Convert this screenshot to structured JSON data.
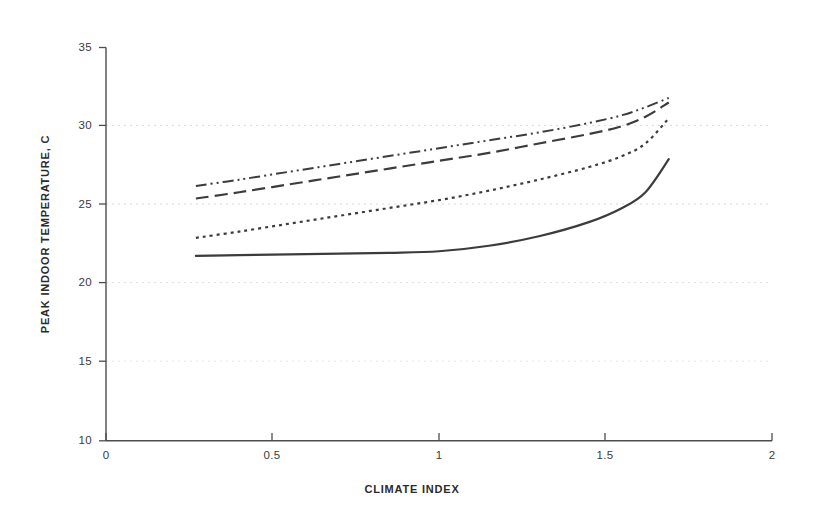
{
  "chart_data": {
    "type": "line",
    "title": "",
    "xlabel": "CLIMATE INDEX",
    "ylabel": "PEAK INDOOR TEMPERATURE, C",
    "xlim": [
      0,
      2
    ],
    "ylim": [
      10,
      35
    ],
    "xticks": [
      "0",
      "0.5",
      "1",
      "1.5",
      "2"
    ],
    "xtick_values": [
      0,
      0.5,
      1,
      1.5,
      2
    ],
    "yticks": [
      "10",
      "15",
      "20",
      "25",
      "30",
      "35"
    ],
    "ytick_values": [
      10,
      15,
      20,
      25,
      30,
      35
    ],
    "grid": "horizontal-dotted-faint",
    "legend": "none",
    "line_color": "#3c3c3c",
    "axis_color": "#555555",
    "grid_color": "#d8d8d8",
    "series": [
      {
        "name": "series-1-dash-dot-dot",
        "style": "dash-dot-dot",
        "dasharray": "11,4,2,4,2,4",
        "width": 2.0,
        "x": [
          0.27,
          0.4,
          0.55,
          0.7,
          0.85,
          1.0,
          1.15,
          1.3,
          1.45,
          1.55,
          1.62,
          1.69
        ],
        "values": [
          26.2,
          26.6,
          27.1,
          27.6,
          28.1,
          28.6,
          29.1,
          29.6,
          30.2,
          30.7,
          31.2,
          31.8
        ]
      },
      {
        "name": "series-2-dashed",
        "style": "dashed",
        "dasharray": "13,6",
        "width": 2.2,
        "x": [
          0.27,
          0.4,
          0.55,
          0.7,
          0.85,
          1.0,
          1.15,
          1.3,
          1.45,
          1.55,
          1.62,
          1.69
        ],
        "values": [
          25.4,
          25.8,
          26.3,
          26.8,
          27.3,
          27.8,
          28.3,
          28.9,
          29.5,
          30.0,
          30.6,
          31.5
        ]
      },
      {
        "name": "series-3-dotted",
        "style": "dotted",
        "dasharray": "3,4",
        "width": 2.2,
        "x": [
          0.27,
          0.4,
          0.55,
          0.7,
          0.85,
          1.0,
          1.15,
          1.3,
          1.45,
          1.55,
          1.62,
          1.69
        ],
        "values": [
          22.9,
          23.3,
          23.8,
          24.3,
          24.8,
          25.3,
          25.9,
          26.6,
          27.4,
          28.1,
          28.9,
          30.5
        ]
      },
      {
        "name": "series-4-solid",
        "style": "solid",
        "dasharray": "none",
        "width": 2.2,
        "x": [
          0.27,
          0.4,
          0.55,
          0.7,
          0.85,
          1.0,
          1.15,
          1.3,
          1.45,
          1.55,
          1.62,
          1.69
        ],
        "values": [
          21.75,
          21.8,
          21.85,
          21.9,
          21.95,
          22.05,
          22.4,
          23.0,
          23.9,
          24.8,
          25.8,
          27.9
        ]
      }
    ]
  },
  "axes": {
    "x_title": "CLIMATE INDEX",
    "y_title": "PEAK INDOOR TEMPERATURE, C",
    "x_tick_labels": [
      "0",
      "0.5",
      "1",
      "1.5",
      "2"
    ],
    "y_tick_labels": [
      "35",
      "30",
      "25",
      "20",
      "15",
      "10"
    ]
  }
}
